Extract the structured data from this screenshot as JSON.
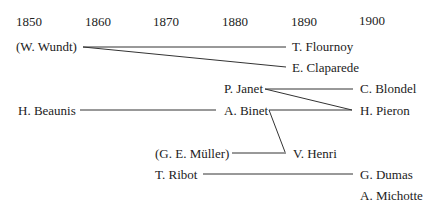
{
  "timeline": {
    "years": [
      "1850",
      "1860",
      "1870",
      "1880",
      "1890",
      "1900"
    ]
  },
  "people": {
    "wundt": "(W. Wundt)",
    "flournoy": "T. Flournoy",
    "claparede": "E. Claparede",
    "janet": "P. Janet",
    "blondel": "C. Blondel",
    "beaunis": "H. Beaunis",
    "binet": "A. Binet",
    "pieron": "H. Pieron",
    "muller": "(G. E. Müller)",
    "henri": "V. Henri",
    "ribot": "T. Ribot",
    "dumas": "G. Dumas",
    "michotte": "A. Michotte"
  },
  "links": [
    [
      "(W. Wundt)",
      "T. Flournoy"
    ],
    [
      "(W. Wundt)",
      "E. Claparede"
    ],
    [
      "P. Janet",
      "C. Blondel"
    ],
    [
      "P. Janet",
      "H. Pieron"
    ],
    [
      "H. Beaunis",
      "A. Binet"
    ],
    [
      "A. Binet",
      "H. Pieron"
    ],
    [
      "A. Binet",
      "V. Henri"
    ],
    [
      "(G. E. Müller)",
      "V. Henri"
    ],
    [
      "T. Ribot",
      "G. Dumas"
    ]
  ]
}
